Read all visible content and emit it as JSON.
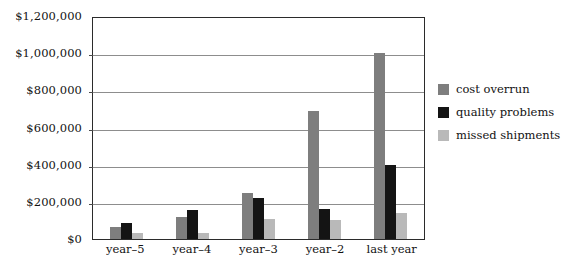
{
  "chart_data": {
    "type": "bar",
    "title": "",
    "xlabel": "",
    "ylabel": "",
    "ylim": [
      0,
      1200000
    ],
    "ytick_step": 200000,
    "grid": true,
    "legend_position": "right",
    "categories": [
      "year–5",
      "year–4",
      "year–3",
      "year–2",
      "last year"
    ],
    "ytick_labels": [
      "$0",
      "$200,000",
      "$400,000",
      "$600,000",
      "$800,000",
      "$1,000,000",
      "$1,200,000"
    ],
    "ytick_values": [
      0,
      200000,
      400000,
      600000,
      800000,
      1000000,
      1200000
    ],
    "series": [
      {
        "name": "cost overrun",
        "color": "#7e7e7e",
        "values": [
          65000,
          120000,
          245000,
          690000,
          1000000
        ]
      },
      {
        "name": "quality problems",
        "color": "#141414",
        "values": [
          85000,
          155000,
          220000,
          160000,
          400000
        ]
      },
      {
        "name": "missed shipments",
        "color": "#b9b9b9",
        "values": [
          35000,
          35000,
          110000,
          105000,
          140000
        ]
      }
    ]
  },
  "colors": {
    "cost_overrun": "#7e7e7e",
    "quality_problems": "#141414",
    "missed_shipments": "#b9b9b9",
    "frame": "#2b2b2b",
    "gridline": "#8d8d8d",
    "background": "#ffffff"
  }
}
